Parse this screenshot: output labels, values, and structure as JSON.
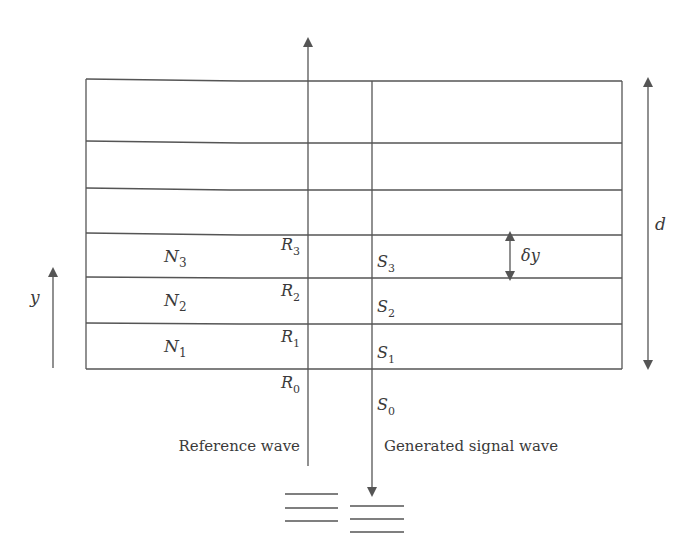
{
  "diagram": {
    "colors": {
      "line": "#555555",
      "text": "#3a3a3a",
      "background": "#ffffff"
    },
    "layers": {
      "labels": [
        {
          "name": "N",
          "sub": "3"
        },
        {
          "name": "N",
          "sub": "2"
        },
        {
          "name": "N",
          "sub": "1"
        }
      ],
      "count_visible": 6
    },
    "reference_points": [
      {
        "name": "R",
        "sub": "3"
      },
      {
        "name": "R",
        "sub": "2"
      },
      {
        "name": "R",
        "sub": "1"
      },
      {
        "name": "R",
        "sub": "0"
      }
    ],
    "signal_points": [
      {
        "name": "S",
        "sub": "3"
      },
      {
        "name": "S",
        "sub": "2"
      },
      {
        "name": "S",
        "sub": "1"
      },
      {
        "name": "S",
        "sub": "0"
      }
    ],
    "labels": {
      "reference_wave": "Reference wave",
      "signal_wave": "Generated signal wave",
      "thickness": "d",
      "layer_spacing": "δy",
      "axis": "y"
    }
  }
}
